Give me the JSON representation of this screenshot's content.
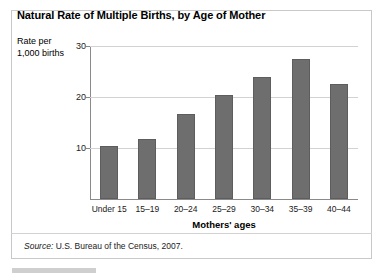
{
  "figure": {
    "title": "Natural Rate of Multiple Births, by Age of Mother",
    "y_axis_title_line1": "Rate per",
    "y_axis_title_line2": "1,000 births",
    "x_axis_title": "Mothers' ages",
    "source_label": "Source:",
    "source_text": " U.S. Bureau of the Census, 2007.",
    "bar_color": "#6e6e6e",
    "gridline_color": "#d2d2d2",
    "axis_color": "#8a8a8a",
    "frame_color": "#c8c8c8"
  },
  "chart_data": {
    "type": "bar",
    "title": "Natural Rate of Multiple Births, by Age of Mother",
    "xlabel": "Mothers' ages",
    "ylabel": "Rate per 1,000 births",
    "categories": [
      "Under 15",
      "15–19",
      "20–24",
      "25–29",
      "30–34",
      "35–39",
      "40–44"
    ],
    "values": [
      10.4,
      11.8,
      16.7,
      20.3,
      24.0,
      27.5,
      22.5
    ],
    "ylim": [
      0,
      30
    ],
    "yticks": [
      10,
      20,
      30
    ],
    "ytick_labels": [
      "10",
      "20",
      "30"
    ],
    "grid": true,
    "legend": false,
    "source": "Source: U.S. Bureau of the Census, 2007."
  }
}
